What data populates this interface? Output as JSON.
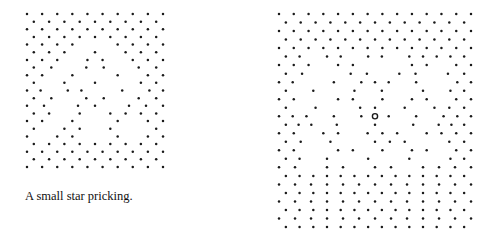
{
  "figures": [
    {
      "id": "small-star",
      "caption": "A small star pricking.",
      "dot_color": "#1a1a1a",
      "rows": [
        "..........",
        ".........",
        "..........",
        ".........",
        "....  ....",
        "... . ...",
        "... .. ...",
        ".. .. ..",
        ".. .  . ..",
        ". . .  ..",
        ".. ..  . ..",
        ".. .. ..",
        ".. .. ...",
        ".. . ....",
        ".. .  . ..",
        ". .. .  .",
        ". ..  . ..",
        ".........",
        "..........",
        ".........",
        ".........."
      ]
    },
    {
      "id": "large-star",
      "caption": "",
      "dot_color": "#1a1a1a",
      "center_marker": "open-circle",
      "rows": [
        "..............",
        ".............",
        "..............",
        ".............",
        "..............",
        ".. .. .. .....",
        "... ..   .. ..",
        "..  .. .. ..",
        "..  . ... .  ..",
        ". .  . .  . ..",
        "..  .. . .. ..",
        ". .  .. . ...",
        "... . .o. . ...",
        "... .  .  . ...",
        ".. .. ... ....",
        ".. .  ...  ..",
        "..  .. . .. ..",
        ".. .  .  .  ..",
        ".. .. .. ....",
        "..............",
        ".............",
        "..............",
        ".............",
        "..............",
        ".............",
        ".............."
      ]
    }
  ]
}
